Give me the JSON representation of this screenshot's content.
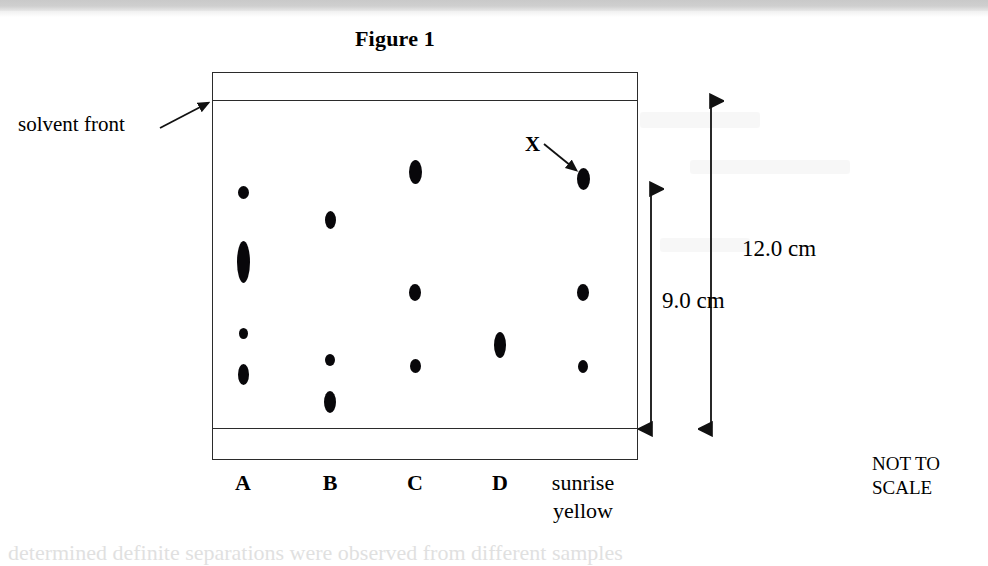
{
  "figure": {
    "title": "Figure 1",
    "not_to_scale": [
      "NOT TO",
      "SCALE"
    ],
    "caption_cut": "determined definite separations were observed from different samples"
  },
  "annotations": {
    "solvent_front_label": "solvent front",
    "unknown_spot_label": "X"
  },
  "measurements": {
    "inner_label": "9.0 cm",
    "outer_label": "12.0 cm"
  },
  "lanes": [
    {
      "id": "A",
      "label": "A",
      "label_line2": "",
      "bold": true,
      "x": 243
    },
    {
      "id": "B",
      "label": "B",
      "label_line2": "",
      "bold": true,
      "x": 330
    },
    {
      "id": "C",
      "label": "C",
      "label_line2": "",
      "bold": true,
      "x": 415
    },
    {
      "id": "D",
      "label": "D",
      "label_line2": "",
      "bold": true,
      "x": 500
    },
    {
      "id": "SY",
      "label": "sunrise",
      "label_line2": "yellow",
      "bold": false,
      "x": 583
    }
  ],
  "chart_data": {
    "type": "scatter",
    "title": "Figure 1",
    "subtitle": "Paper chromatogram of food dyes",
    "xlabel": "",
    "ylabel": "distance travelled",
    "grid": false,
    "legend": "none",
    "baseline_px": 428,
    "solvent_front_px": 100,
    "solvent_front_distance_cm": 12.0,
    "spot_zone_distance_cm": 9.0,
    "categories": [
      "A",
      "B",
      "C",
      "D",
      "sunrise yellow"
    ],
    "annotations": [
      "solvent front",
      "X",
      "NOT TO SCALE",
      "9.0 cm",
      "12.0 cm"
    ],
    "series": [
      {
        "name": "A",
        "spot_count": 4,
        "spots": [
          {
            "cx": 243,
            "cy": 192,
            "rx": 5.5,
            "ry": 6.5
          },
          {
            "cx": 243,
            "cy": 262,
            "rx": 6.5,
            "ry": 21.0
          },
          {
            "cx": 243,
            "cy": 333,
            "rx": 4.5,
            "ry": 5.5
          },
          {
            "cx": 243,
            "cy": 374,
            "rx": 5.5,
            "ry": 10.5
          }
        ]
      },
      {
        "name": "B",
        "spot_count": 3,
        "spots": [
          {
            "cx": 330,
            "cy": 220,
            "rx": 5.5,
            "ry": 9.0
          },
          {
            "cx": 330,
            "cy": 360,
            "rx": 5.0,
            "ry": 6.0
          },
          {
            "cx": 330,
            "cy": 402,
            "rx": 6.0,
            "ry": 11.0
          }
        ]
      },
      {
        "name": "C",
        "spot_count": 3,
        "spots": [
          {
            "cx": 415,
            "cy": 172,
            "rx": 6.5,
            "ry": 12.0
          },
          {
            "cx": 415,
            "cy": 292,
            "rx": 6.0,
            "ry": 8.5
          },
          {
            "cx": 415,
            "cy": 366,
            "rx": 5.5,
            "ry": 7.0
          }
        ]
      },
      {
        "name": "D",
        "spot_count": 1,
        "spots": [
          {
            "cx": 500,
            "cy": 345,
            "rx": 6.0,
            "ry": 13.0
          }
        ]
      },
      {
        "name": "sunrise yellow",
        "spot_count": 3,
        "spots": [
          {
            "cx": 583,
            "cy": 179,
            "rx": 6.5,
            "ry": 11.0
          },
          {
            "cx": 583,
            "cy": 292,
            "rx": 6.0,
            "ry": 8.5
          },
          {
            "cx": 583,
            "cy": 366,
            "rx": 5.0,
            "ry": 6.5
          }
        ]
      }
    ]
  }
}
